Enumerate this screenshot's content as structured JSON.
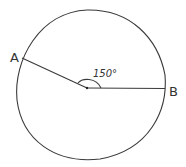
{
  "diagram": {
    "type": "circle-central-angle",
    "points": {
      "A": {
        "label": "A"
      },
      "B": {
        "label": "B"
      }
    },
    "angle": {
      "label": "150°",
      "vertex": "center",
      "between": [
        "A",
        "B"
      ]
    },
    "stroke_color": "#3a3a3a",
    "background": "#ffffff"
  }
}
